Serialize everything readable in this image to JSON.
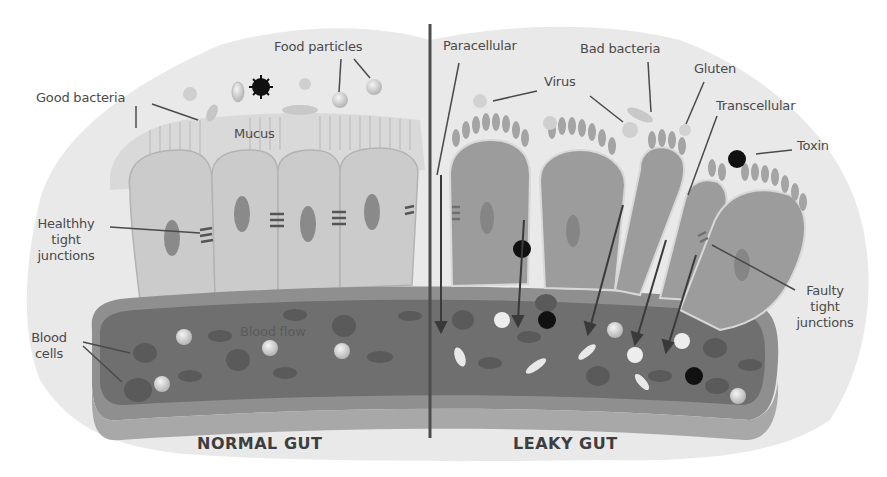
{
  "title": "LEAKY GUT SYNDROME",
  "colors": {
    "background": "#ffffff",
    "lumen": "#e8e8e8",
    "cell_normal": "#c9c9c9",
    "cell_leaky": "#9a9a9a",
    "nucleus": "#7d7d7d",
    "vessel_outer": "#8e8e8e",
    "vessel_inner": "#6e6e6e",
    "divider": "#4d4d4d",
    "toxin": "#111111",
    "label_text": "#4a4a4a"
  },
  "sections": {
    "normal": {
      "label": "NORMAL GUT"
    },
    "leaky": {
      "label": "LEAKY GUT"
    }
  },
  "labels": {
    "food_particles": "Food particles",
    "good_bacteria": "Good bacteria",
    "mucus": "Mucus",
    "healthy_tight_junctions": [
      "Healthhy",
      "tight",
      "junctions"
    ],
    "blood_cells": [
      "Blood",
      "cells"
    ],
    "blood_flow": "Blood flow",
    "paracellular": "Paracellular",
    "virus": "Virus",
    "bad_bacteria": "Bad bacteria",
    "gluten": "Gluten",
    "transcellular": "Transcellular",
    "toxin": "Toxin",
    "faulty_tight_junctions": [
      "Faulty",
      "tight",
      "junctions"
    ]
  }
}
